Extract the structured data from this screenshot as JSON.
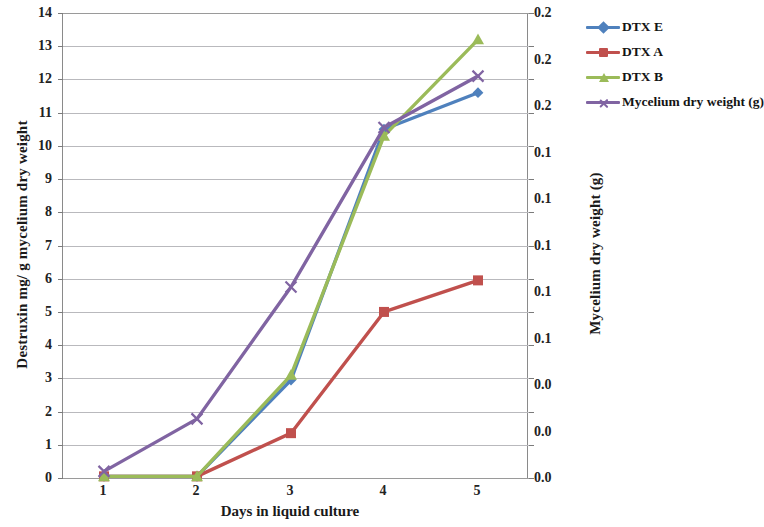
{
  "chart_data": {
    "type": "line",
    "title": "",
    "xlabel": "Days in liquid culture",
    "ylabel": "Destruxin mg/ g mycelium dry weight",
    "ylabel_secondary": "Mycelium dry weight (g)",
    "x": [
      1,
      2,
      3,
      4,
      5
    ],
    "xtick_labels": [
      "1",
      "2",
      "3",
      "4",
      "5"
    ],
    "ylim": [
      0,
      14
    ],
    "ytick_labels": [
      "0",
      "1",
      "2",
      "3",
      "4",
      "5",
      "6",
      "7",
      "8",
      "9",
      "10",
      "11",
      "12",
      "13",
      "14"
    ],
    "ylim_secondary": [
      0.0,
      0.2
    ],
    "ytick_labels_secondary": [
      "0.0",
      "0.0",
      "0.0",
      "0.1",
      "0.1",
      "0.1",
      "0.1",
      "0.1",
      "0.2",
      "0.2",
      "0.2"
    ],
    "grid": true,
    "legend_position": "right",
    "series": [
      {
        "name": "DTX E",
        "color": "#4f81bd",
        "marker": "diamond",
        "axis": "left",
        "values": [
          0.05,
          0.05,
          2.95,
          10.5,
          11.6
        ]
      },
      {
        "name": "DTX A",
        "color": "#c0504d",
        "marker": "square",
        "axis": "left",
        "values": [
          0.05,
          0.05,
          1.35,
          5.0,
          5.95
        ]
      },
      {
        "name": "DTX B",
        "color": "#9bbb59",
        "marker": "triangle",
        "axis": "left",
        "values": [
          0.05,
          0.05,
          3.1,
          10.3,
          13.2
        ]
      },
      {
        "name": "Mycelium dry weight (g)",
        "color": "#8064a2",
        "marker": "x",
        "axis": "right",
        "values": [
          0.2,
          1.78,
          5.75,
          10.55,
          12.1
        ],
        "values_secondary": [
          0.003,
          0.025,
          0.082,
          0.151,
          0.173
        ]
      }
    ]
  },
  "legend": {
    "items": [
      {
        "label": "DTX E",
        "color": "#4f81bd",
        "marker": "diamond-marker-icon"
      },
      {
        "label": "DTX A",
        "color": "#c0504d",
        "marker": "square-marker-icon"
      },
      {
        "label": "DTX B",
        "color": "#9bbb59",
        "marker": "triangle-marker-icon"
      },
      {
        "label": "Mycelium dry weight (g)",
        "color": "#8064a2",
        "marker": "x-marker-icon"
      }
    ]
  }
}
